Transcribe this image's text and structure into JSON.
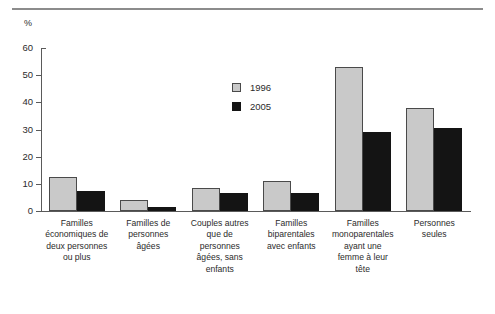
{
  "chart_data": {
    "type": "bar",
    "title": "",
    "xlabel": "",
    "ylabel": "%",
    "ylim": [
      0,
      60
    ],
    "yticks": [
      0,
      10,
      20,
      30,
      40,
      50,
      60
    ],
    "grid": false,
    "legend_position": "inside-upper-center",
    "categories": [
      "Familles économiques de deux personnes ou plus",
      "Familles de personnes âgées",
      "Couples autres que de personnes âgées, sans enfants",
      "Familles biparentales avec enfants",
      "Familles monoparentales ayant une femme à leur tête",
      "Personnes seules"
    ],
    "category_lines": [
      [
        "Familles",
        "économiques de",
        "deux personnes",
        "ou plus"
      ],
      [
        "Familles de",
        "personnes",
        "âgées"
      ],
      [
        "Couples autres",
        "que de",
        "personnes",
        "âgées, sans",
        "enfants"
      ],
      [
        "Familles",
        "biparentales",
        "avec enfants"
      ],
      [
        "Familles",
        "monoparentales",
        "ayant une",
        "femme à leur",
        "tête"
      ],
      [
        "Personnes",
        "seules"
      ]
    ],
    "series": [
      {
        "name": "1996",
        "color": "#c9c9c9",
        "values": [
          12.5,
          4.0,
          8.5,
          11.0,
          53.0,
          38.0
        ]
      },
      {
        "name": "2005",
        "color": "#141414",
        "values": [
          7.5,
          1.5,
          6.5,
          6.5,
          29.0,
          30.5
        ]
      }
    ]
  },
  "legend": {
    "items": [
      {
        "label": "1996"
      },
      {
        "label": "2005"
      }
    ]
  },
  "axis": {
    "unit": "%",
    "tick_labels": [
      "60",
      "50",
      "40",
      "30",
      "20",
      "10",
      "0"
    ]
  }
}
